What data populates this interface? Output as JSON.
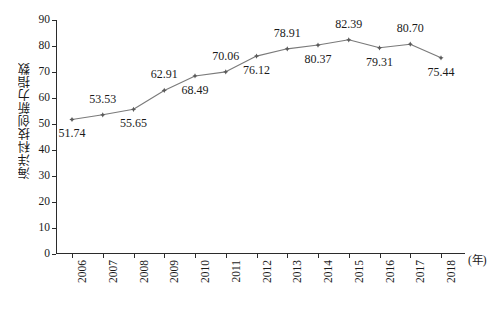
{
  "chart_data": {
    "type": "line",
    "title": "",
    "xlabel": "(年)",
    "ylabel": "海洋科技创新力指数",
    "categories": [
      "2006",
      "2007",
      "2008",
      "2009",
      "2010",
      "2011",
      "2012",
      "2013",
      "2014",
      "2015",
      "2016",
      "2017",
      "2018"
    ],
    "values": [
      51.74,
      53.53,
      55.65,
      62.91,
      68.49,
      70.06,
      76.12,
      78.91,
      80.37,
      82.39,
      79.31,
      80.7,
      75.44
    ],
    "value_labels": [
      "51.74",
      "53.53",
      "55.65",
      "62.91",
      "68.49",
      "70.06",
      "76.12",
      "78.91",
      "80.37",
      "82.39",
      "79.31",
      "80.70",
      "75.44"
    ],
    "label_positions": [
      "below",
      "above",
      "below",
      "above",
      "below",
      "above",
      "below",
      "above",
      "below",
      "above",
      "below",
      "above",
      "below"
    ],
    "ylim": [
      0,
      90
    ],
    "y_ticks": [
      "0",
      "10",
      "20",
      "30",
      "40",
      "50",
      "60",
      "70",
      "80",
      "90"
    ],
    "grid": false,
    "legend": "none",
    "series": [
      {
        "name": "海洋科技创新力指数",
        "values": [
          51.74,
          53.53,
          55.65,
          62.91,
          68.49,
          70.06,
          76.12,
          78.91,
          80.37,
          82.39,
          79.31,
          80.7,
          75.44
        ]
      }
    ],
    "line_color": "#7a7a7a",
    "marker_color": "#5a5a5a",
    "marker": "star-diamond"
  },
  "axes": {
    "y_unit_suffix": "",
    "x_unit": "(年)"
  },
  "caption": {
    "text": ""
  }
}
